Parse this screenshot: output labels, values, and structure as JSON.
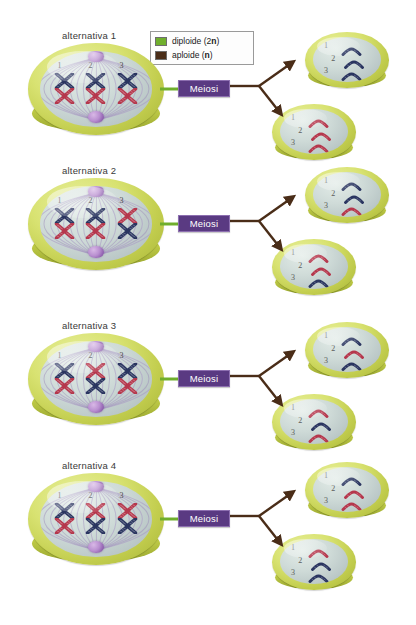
{
  "legend": {
    "rows": [
      {
        "label_pre": "diploide (2",
        "label_bold": "n",
        "label_post": ")",
        "full": "diploide (2n)",
        "color": "#6fae2c",
        "swatch": "green"
      },
      {
        "label_pre": "aploide (",
        "label_bold": "n",
        "label_post": ")",
        "full": "aploide (n)",
        "color": "#4a2d18",
        "swatch": "brown"
      }
    ]
  },
  "process_label": "Meiosi",
  "colors": {
    "blue_chromosome": "#2a3560",
    "red_chromosome": "#b5374c",
    "dish_rim": "#c3ce4f",
    "dish_inner": "#cfdbd8",
    "centrosome": "#8e5fae",
    "meiosi_box": "#5a3a82",
    "diploid_line": "#6fae2c",
    "haploid_arrow": "#4a2d18"
  },
  "chromosome_numbers": [
    "1",
    "2",
    "3"
  ],
  "alternatives": [
    {
      "label": "alternativa 1",
      "parent": {
        "pairs": [
          {
            "num": "1",
            "top": "blue",
            "bottom": "red"
          },
          {
            "num": "2",
            "top": "blue",
            "bottom": "red"
          },
          {
            "num": "3",
            "top": "blue",
            "bottom": "red"
          }
        ]
      },
      "daughter_top": {
        "chromosomes": [
          {
            "num": "1",
            "color": "blue"
          },
          {
            "num": "2",
            "color": "blue"
          },
          {
            "num": "3",
            "color": "blue"
          }
        ]
      },
      "daughter_bottom": {
        "chromosomes": [
          {
            "num": "1",
            "color": "red"
          },
          {
            "num": "2",
            "color": "red"
          },
          {
            "num": "3",
            "color": "red"
          }
        ]
      }
    },
    {
      "label": "alternativa 2",
      "parent": {
        "pairs": [
          {
            "num": "1",
            "top": "blue",
            "bottom": "red"
          },
          {
            "num": "2",
            "top": "blue",
            "bottom": "red"
          },
          {
            "num": "3",
            "top": "red",
            "bottom": "blue"
          }
        ]
      },
      "daughter_top": {
        "chromosomes": [
          {
            "num": "1",
            "color": "blue"
          },
          {
            "num": "2",
            "color": "blue"
          },
          {
            "num": "3",
            "color": "red"
          }
        ]
      },
      "daughter_bottom": {
        "chromosomes": [
          {
            "num": "1",
            "color": "red"
          },
          {
            "num": "2",
            "color": "red"
          },
          {
            "num": "3",
            "color": "blue"
          }
        ]
      }
    },
    {
      "label": "alternativa 3",
      "parent": {
        "pairs": [
          {
            "num": "1",
            "top": "blue",
            "bottom": "red"
          },
          {
            "num": "2",
            "top": "red",
            "bottom": "blue"
          },
          {
            "num": "3",
            "top": "blue",
            "bottom": "red"
          }
        ]
      },
      "daughter_top": {
        "chromosomes": [
          {
            "num": "1",
            "color": "blue"
          },
          {
            "num": "2",
            "color": "red"
          },
          {
            "num": "3",
            "color": "blue"
          }
        ]
      },
      "daughter_bottom": {
        "chromosomes": [
          {
            "num": "1",
            "color": "red"
          },
          {
            "num": "2",
            "color": "blue"
          },
          {
            "num": "3",
            "color": "red"
          }
        ]
      }
    },
    {
      "label": "alternativa 4",
      "parent": {
        "pairs": [
          {
            "num": "1",
            "top": "blue",
            "bottom": "red"
          },
          {
            "num": "2",
            "top": "red",
            "bottom": "blue"
          },
          {
            "num": "3",
            "top": "red",
            "bottom": "blue"
          }
        ]
      },
      "daughter_top": {
        "chromosomes": [
          {
            "num": "1",
            "color": "blue"
          },
          {
            "num": "2",
            "color": "red"
          },
          {
            "num": "3",
            "color": "red"
          }
        ]
      },
      "daughter_bottom": {
        "chromosomes": [
          {
            "num": "1",
            "color": "red"
          },
          {
            "num": "2",
            "color": "blue"
          },
          {
            "num": "3",
            "color": "blue"
          }
        ]
      }
    }
  ]
}
